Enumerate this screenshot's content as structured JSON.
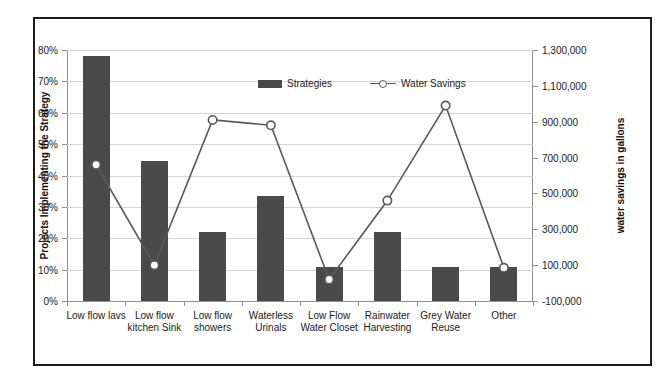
{
  "chart_data": {
    "type": "bar",
    "title": "",
    "categories": [
      "Low flow lavs",
      "Low flow kitchen Sink",
      "Low flow showers",
      "Waterless Urinals",
      "Low Flow Water Closet",
      "Rainwater Harvesting",
      "Grey Water Reuse",
      "Other"
    ],
    "category_lines": [
      [
        "Low flow lavs"
      ],
      [
        "Low flow",
        "kitchen Sink"
      ],
      [
        "Low flow",
        "showers"
      ],
      [
        "Waterless",
        "Urinals"
      ],
      [
        "Low Flow",
        "Water Closet"
      ],
      [
        "Rainwater",
        "Harvesting"
      ],
      [
        "Grey Water",
        "Reuse"
      ],
      [
        "Other"
      ]
    ],
    "series": [
      {
        "name": "Strategies",
        "type": "bar",
        "axis": "left",
        "color": "#4a4a4a",
        "values": [
          78,
          44.5,
          22,
          33.5,
          11,
          22,
          11,
          11
        ]
      },
      {
        "name": "Water Savings",
        "type": "line",
        "axis": "right",
        "color": "#595959",
        "marker": "open-circle",
        "values": [
          660000,
          100000,
          910000,
          880000,
          20000,
          460000,
          990000,
          85000
        ]
      }
    ],
    "xlabel": "",
    "ylabel": "Projects Implementing the Strategy",
    "y2label": "water savings in gallons",
    "ylim": [
      0,
      80
    ],
    "y2lim": [
      -100000,
      1300000
    ],
    "yticks": [
      "0%",
      "10%",
      "20%",
      "30%",
      "40%",
      "50%",
      "60%",
      "70%",
      "80%"
    ],
    "ytick_values": [
      0,
      10,
      20,
      30,
      40,
      50,
      60,
      70,
      80
    ],
    "y2ticks": [
      "-100,000",
      "100,000",
      "300,000",
      "500,000",
      "700,000",
      "900,000",
      "1,100,000",
      "1,300,000"
    ],
    "y2tick_values": [
      -100000,
      100000,
      300000,
      500000,
      700000,
      900000,
      1100000,
      1300000
    ],
    "grid": true,
    "legend": [
      "Strategies",
      "Water Savings"
    ],
    "legend_position": "top-center"
  }
}
